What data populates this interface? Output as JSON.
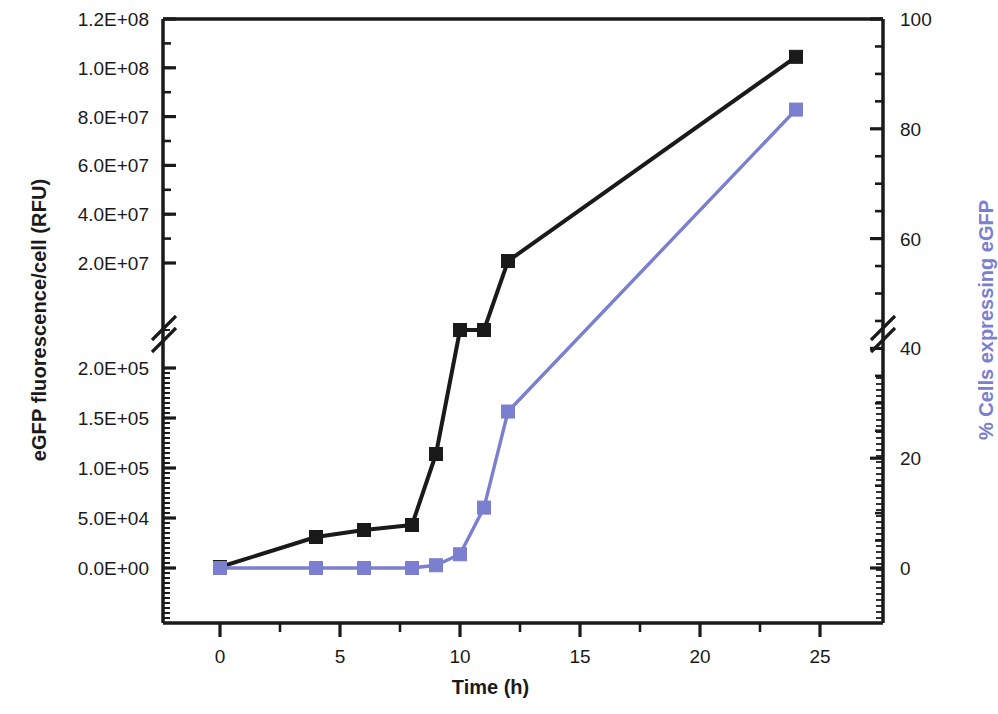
{
  "chart_data": {
    "type": "line",
    "title": "",
    "xlabel": "Time (h)",
    "ylabel": "eGFP fluorescence/cell (RFU)",
    "ylabel_right": "% Cells expressing eGFP",
    "grid": false,
    "legend": "none",
    "xlim": [
      -2.5,
      27
    ],
    "xticks": [
      0,
      5,
      10,
      15,
      20,
      25
    ],
    "xtick_labels": [
      "0",
      "5",
      "10",
      "15",
      "20",
      "25"
    ],
    "x_minor_ticks": [
      2.5,
      7.5,
      12.5,
      17.5,
      22.5
    ],
    "broken_axis": true,
    "axis_break_note": "Left axis broken between 2.0E+05 and 2.0E+07; right axis broken near 45%",
    "y_left_lower_range": [
      0,
      200000
    ],
    "y_left_upper_range": [
      20000000,
      120000000
    ],
    "y_left_tick_labels": [
      "1.2E+08",
      "1.0E+08",
      "8.0E+07",
      "6.0E+07",
      "4.0E+07",
      "2.0E+07",
      "2.0E+05",
      "1.5E+05",
      "1.0E+05",
      "5.0E+04",
      "0.0E+00"
    ],
    "y_left_tick_values": [
      120000000,
      100000000,
      80000000,
      60000000,
      40000000,
      20000000,
      200000,
      150000,
      100000,
      50000,
      0
    ],
    "y_right_range": [
      0,
      100
    ],
    "y_right_tick_labels": [
      "100",
      "80",
      "60",
      "40",
      "20",
      "0"
    ],
    "y_right_tick_values": [
      100,
      80,
      60,
      40,
      20,
      0
    ],
    "series": [
      {
        "name": "eGFP fluorescence/cell (RFU)",
        "axis": "left",
        "color": "#1a1a1a",
        "marker": "square",
        "x": [
          0,
          4,
          6,
          8,
          9,
          10,
          11,
          12,
          24
        ],
        "values": [
          1000,
          31000,
          38000,
          43000,
          114000,
          10000000,
          13500000,
          20800000,
          104500000
        ],
        "value_labels": [
          "0.0E+00",
          "3.1E+04",
          "3.8E+04",
          "4.3E+04",
          "1.14E+05",
          "1.0E+07",
          "1.35E+07",
          "2.08E+07",
          "1.045E+08"
        ]
      },
      {
        "name": "% Cells expressing eGFP",
        "axis": "right",
        "color": "#7a7fd0",
        "marker": "square",
        "x": [
          0,
          4,
          6,
          8,
          9,
          10,
          11,
          12,
          24
        ],
        "values": [
          0,
          0,
          0,
          0,
          0.5,
          2.5,
          11,
          28.5,
          83.5
        ],
        "value_labels": [
          "0",
          "0",
          "0",
          "0",
          "0.5",
          "2.5",
          "11",
          "28.5",
          "83.5"
        ]
      }
    ]
  },
  "axes": {
    "x_title": "Time (h)",
    "y_left_title": "eGFP fluorescence/cell (RFU)",
    "y_right_title": "% Cells expressing eGFP"
  },
  "colors": {
    "series_black": "#1a1a1a",
    "series_blue": "#7a7fd0",
    "axis": "#1a1a1a",
    "background": "#ffffff"
  }
}
